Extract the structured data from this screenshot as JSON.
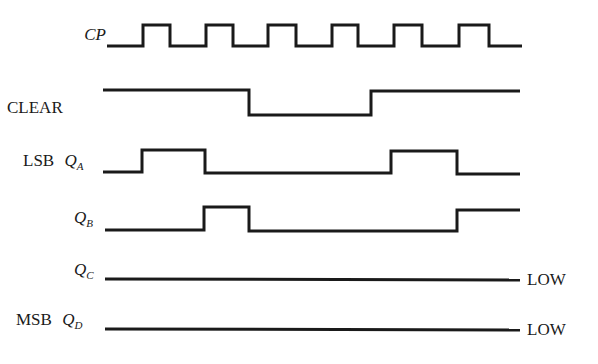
{
  "diagram": {
    "type": "timing-diagram",
    "signals": [
      {
        "id": "cp",
        "prefix": "",
        "name": "CP",
        "sub": "",
        "italic": true,
        "label_x": 55,
        "label_y": 28,
        "points": "107,46 143,46 143,25 170,25 170,46 206,46 206,25 233,25 233,46 268,46 268,25 296,25 296,46 332,46 332,25 358,25 358,46 394,46 394,25 422,25 422,46 459,46 459,25 489,25 489,46 522,46",
        "end_label": ""
      },
      {
        "id": "clear",
        "prefix": "",
        "name": "CLEAR",
        "sub": "",
        "italic": false,
        "label_x": 8,
        "label_y": 103,
        "points": "103,90 249,90 249,115 371,115 371,91 520,91",
        "end_label": ""
      },
      {
        "id": "qa",
        "prefix": "LSB",
        "name": "Q",
        "sub": "A",
        "italic": true,
        "label_x": 25,
        "label_y": 156,
        "points": "103,172 142,172 142,150 205,150 205,173 391,173 391,151 457,151 457,174 520,174",
        "end_label": ""
      },
      {
        "id": "qb",
        "prefix": "",
        "name": "Q",
        "sub": "B",
        "italic": true,
        "label_x": 75,
        "label_y": 214,
        "points": "105,230 204,230 204,207 249,207 249,231 457,231 457,210 520,210",
        "end_label": ""
      },
      {
        "id": "qc",
        "prefix": "",
        "name": "Q",
        "sub": "C",
        "italic": true,
        "label_x": 75,
        "label_y": 266,
        "points": "105,279 520,280",
        "end_label": "LOW",
        "end_label_x": 527,
        "end_label_y": 270
      },
      {
        "id": "qd",
        "prefix": "MSB",
        "name": "Q",
        "sub": "D",
        "italic": true,
        "label_x": 17,
        "label_y": 316,
        "points": "105,329 520,330",
        "end_label": "LOW",
        "end_label_x": 527,
        "end_label_y": 320
      }
    ]
  },
  "labels": {
    "cp": "CP",
    "clear": "CLEAR",
    "lsb": "LSB",
    "msb": "MSB",
    "q": "Q",
    "sub_a": "A",
    "sub_b": "B",
    "sub_c": "C",
    "sub_d": "D",
    "low_c": "LOW",
    "low_d": "LOW"
  }
}
